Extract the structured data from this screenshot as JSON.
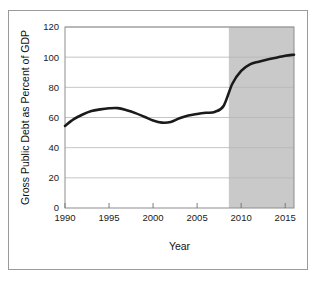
{
  "figure": {
    "background_color": "#ffffff",
    "frame_color": "#9a9a9a"
  },
  "chart_data": {
    "type": "line",
    "title": "",
    "xlabel": "Year",
    "ylabel": "Gross Public Debt as Percent of GDP",
    "xlim": [
      1990,
      2016
    ],
    "ylim": [
      0,
      120
    ],
    "grid": true,
    "legend": "none",
    "line_color": "#1a1a1a",
    "line_width": 2.6,
    "xticks": [
      1990,
      1995,
      2000,
      2005,
      2010,
      2015
    ],
    "xtick_labels": [
      "1990",
      "1995",
      "2000",
      "2005",
      "2010",
      "2015"
    ],
    "yticks": [
      0,
      20,
      40,
      60,
      80,
      100,
      120
    ],
    "ytick_labels": [
      "0",
      "20",
      "40",
      "60",
      "80",
      "100",
      "120"
    ],
    "shaded_region": {
      "label": "projected",
      "x_start": 2008.6,
      "x_end": 2016,
      "fill_color": "#c9c9c9"
    },
    "x": [
      1990,
      1991,
      1992,
      1993,
      1994,
      1995,
      1996,
      1997,
      1998,
      1999,
      2000,
      2001,
      2002,
      2003,
      2004,
      2005,
      2006,
      2007,
      2008,
      2009,
      2010,
      2011,
      2012,
      2013,
      2014,
      2015,
      2016
    ],
    "values": [
      54.4,
      58.9,
      62.0,
      64.3,
      65.4,
      66.1,
      66.2,
      64.8,
      62.9,
      60.5,
      58.0,
      56.6,
      57.0,
      59.5,
      61.3,
      62.3,
      63.1,
      63.7,
      67.6,
      82.4,
      90.9,
      95.2,
      97.0,
      98.5,
      99.6,
      101.0,
      101.6
    ]
  }
}
